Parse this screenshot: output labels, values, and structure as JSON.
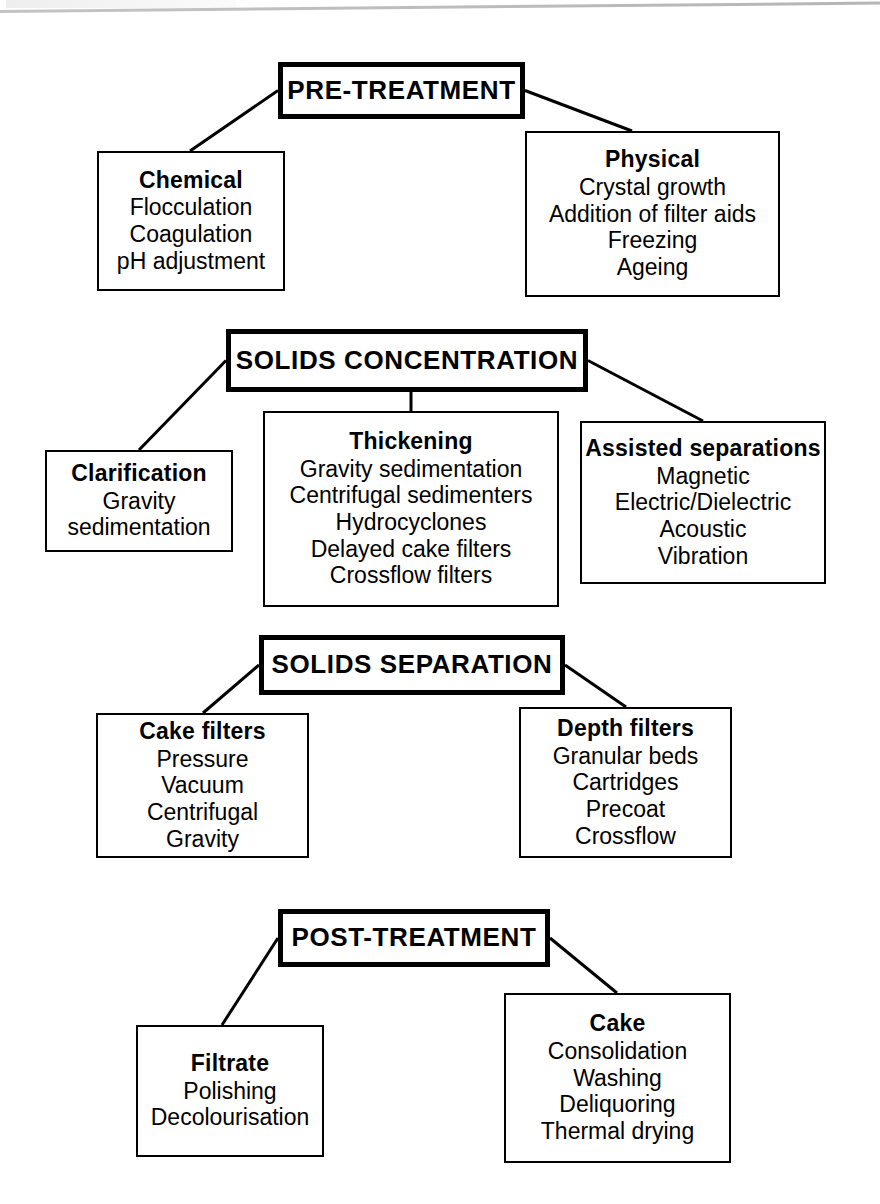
{
  "diagram": {
    "type": "flowchart",
    "stages": [
      {
        "id": "pre-treatment",
        "label": "PRE-TREATMENT",
        "box": {
          "x": 278,
          "y": 62,
          "w": 247,
          "h": 57
        },
        "children": [
          {
            "id": "chemical",
            "title": "Chemical",
            "items": [
              "Flocculation",
              "Coagulation",
              "pH adjustment"
            ],
            "box": {
              "x": 97,
              "y": 151,
              "w": 188,
              "h": 140
            },
            "connect": {
              "from": "left",
              "to_x": 190
            }
          },
          {
            "id": "physical",
            "title": "Physical",
            "items": [
              "Crystal growth",
              "Addition of filter aids",
              "Freezing",
              "Ageing"
            ],
            "box": {
              "x": 525,
              "y": 131,
              "w": 255,
              "h": 166
            },
            "connect": {
              "from": "right",
              "to_x": 632
            }
          }
        ]
      },
      {
        "id": "solids-concentration",
        "label": "SOLIDS CONCENTRATION",
        "box": {
          "x": 226,
          "y": 329,
          "w": 362,
          "h": 63
        },
        "children": [
          {
            "id": "clarification",
            "title": "Clarification",
            "items": [
              "Gravity",
              "sedimentation"
            ],
            "box": {
              "x": 45,
              "y": 450,
              "w": 188,
              "h": 102
            },
            "connect": {
              "from": "left",
              "to_x": 139
            }
          },
          {
            "id": "thickening",
            "title": "Thickening",
            "items": [
              "Gravity sedimentation",
              "Centrifugal sedimenters",
              "Hydrocyclones",
              "Delayed cake filters",
              "Crossflow filters"
            ],
            "box": {
              "x": 263,
              "y": 411,
              "w": 296,
              "h": 196
            },
            "connect": {
              "from": "bottom",
              "to_x": 411
            }
          },
          {
            "id": "assisted-separations",
            "title": "Assisted separations",
            "items": [
              "Magnetic",
              "Electric/Dielectric",
              "Acoustic",
              "Vibration"
            ],
            "box": {
              "x": 580,
              "y": 421,
              "w": 246,
              "h": 163
            },
            "connect": {
              "from": "right",
              "to_x": 703
            }
          }
        ]
      },
      {
        "id": "solids-separation",
        "label": "SOLIDS SEPARATION",
        "box": {
          "x": 259,
          "y": 635,
          "w": 306,
          "h": 60
        },
        "children": [
          {
            "id": "cake-filters",
            "title": "Cake filters",
            "items": [
              "Pressure",
              "Vacuum",
              "Centrifugal",
              "Gravity"
            ],
            "box": {
              "x": 96,
              "y": 713,
              "w": 213,
              "h": 145
            },
            "connect": {
              "from": "left",
              "to_x": 203
            }
          },
          {
            "id": "depth-filters",
            "title": "Depth filters",
            "items": [
              "Granular beds",
              "Cartridges",
              "Precoat",
              "Crossflow"
            ],
            "box": {
              "x": 519,
              "y": 707,
              "w": 213,
              "h": 151
            },
            "connect": {
              "from": "right",
              "to_x": 626
            }
          }
        ]
      },
      {
        "id": "post-treatment",
        "label": "POST-TREATMENT",
        "box": {
          "x": 278,
          "y": 909,
          "w": 272,
          "h": 58
        },
        "children": [
          {
            "id": "filtrate",
            "title": "Filtrate",
            "items": [
              "Polishing",
              "Decolourisation"
            ],
            "box": {
              "x": 136,
              "y": 1025,
              "w": 188,
              "h": 132
            },
            "connect": {
              "from": "left",
              "to_x": 222
            }
          },
          {
            "id": "cake",
            "title": "Cake",
            "items": [
              "Consolidation",
              "Washing",
              "Deliquoring",
              "Thermal drying"
            ],
            "box": {
              "x": 504,
              "y": 993,
              "w": 227,
              "h": 170
            },
            "connect": {
              "from": "right",
              "to_x": 617
            }
          }
        ]
      }
    ]
  },
  "colors": {
    "line": "#000000",
    "box_fill": "#ffffff",
    "text": "#000000",
    "scan_artifact": "#b0b0b0"
  }
}
